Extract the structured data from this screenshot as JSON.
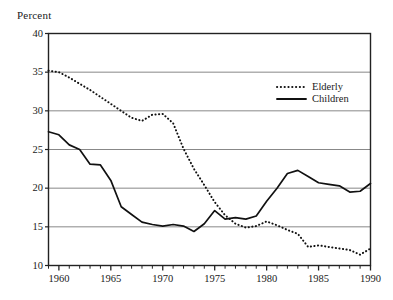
{
  "chart_data": {
    "type": "line",
    "title": "",
    "ylabel": "Percent",
    "xlabel": "",
    "ylim": [
      10,
      40
    ],
    "xlim": [
      1959,
      1990
    ],
    "grid": true,
    "ygrid_values": [
      15,
      20,
      25,
      30,
      35
    ],
    "ytick_labels": [
      "40",
      "35",
      "30",
      "25",
      "20",
      "15",
      "10"
    ],
    "ytick_values": [
      40,
      35,
      30,
      25,
      20,
      15,
      10
    ],
    "xtick_labels": [
      "1960",
      "1965",
      "1970",
      "1975",
      "1980",
      "1985",
      "1990"
    ],
    "xtick_values": [
      1960,
      1965,
      1970,
      1975,
      1980,
      1985,
      1990
    ],
    "minor_xticks_every": 1,
    "legend_position": "top-right-inside",
    "series": [
      {
        "name": "Elderly",
        "style": "dotted",
        "color": "#111111",
        "x": [
          1959,
          1960,
          1961,
          1962,
          1963,
          1964,
          1965,
          1966,
          1967,
          1968,
          1969,
          1970,
          1971,
          1972,
          1973,
          1974,
          1975,
          1976,
          1977,
          1978,
          1979,
          1980,
          1981,
          1982,
          1983,
          1984,
          1985,
          1986,
          1987,
          1988,
          1989,
          1990
        ],
        "values": [
          35.2,
          35.0,
          34.3,
          33.5,
          32.7,
          31.8,
          30.9,
          30.0,
          29.1,
          28.7,
          29.5,
          29.6,
          28.4,
          25.1,
          22.5,
          20.4,
          18.2,
          16.5,
          15.4,
          14.9,
          15.1,
          15.7,
          15.2,
          14.6,
          14.1,
          12.4,
          12.6,
          12.4,
          12.2,
          12.0,
          11.4,
          12.2
        ]
      },
      {
        "name": "Children",
        "style": "solid",
        "color": "#111111",
        "x": [
          1959,
          1960,
          1961,
          1962,
          1963,
          1964,
          1965,
          1966,
          1967,
          1968,
          1969,
          1970,
          1971,
          1972,
          1973,
          1974,
          1975,
          1976,
          1977,
          1978,
          1979,
          1980,
          1981,
          1982,
          1983,
          1984,
          1985,
          1986,
          1987,
          1988,
          1989,
          1990
        ],
        "values": [
          27.3,
          26.9,
          25.6,
          25.0,
          23.1,
          23.0,
          21.0,
          17.6,
          16.6,
          15.6,
          15.3,
          15.1,
          15.3,
          15.1,
          14.4,
          15.4,
          17.1,
          16.0,
          16.2,
          16.0,
          16.4,
          18.3,
          20.0,
          21.9,
          22.3,
          21.5,
          20.7,
          20.5,
          20.3,
          19.5,
          19.6,
          20.6
        ]
      }
    ]
  },
  "legend": {
    "entries": [
      {
        "label": "Elderly",
        "style": "dotted"
      },
      {
        "label": "Children",
        "style": "solid"
      }
    ]
  },
  "axis": {
    "y_title": "Percent"
  },
  "colors": {
    "line": "#111111",
    "grid": "#888888",
    "frame": "#222222",
    "background": "#ffffff"
  }
}
